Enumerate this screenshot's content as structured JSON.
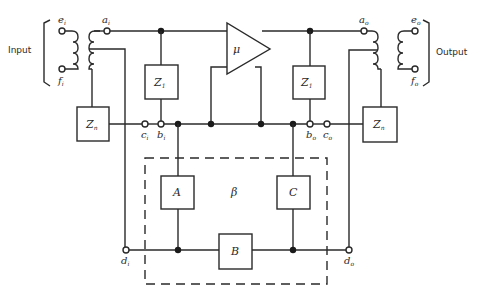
{
  "diagram": {
    "labels": {
      "input": "Input",
      "output": "Output",
      "amplifier": "μ",
      "beta": "β"
    },
    "terminals": {
      "e_i": {
        "main": "e",
        "sub": "i"
      },
      "f_i": {
        "main": "f",
        "sub": "i"
      },
      "a_i": {
        "main": "a",
        "sub": "i"
      },
      "b_i": {
        "main": "b",
        "sub": "i"
      },
      "c_i": {
        "main": "c",
        "sub": "i"
      },
      "d_i": {
        "main": "d",
        "sub": "i"
      },
      "e_o": {
        "main": "e",
        "sub": "o"
      },
      "f_o": {
        "main": "f",
        "sub": "o"
      },
      "a_o": {
        "main": "a",
        "sub": "o"
      },
      "b_o": {
        "main": "b",
        "sub": "o"
      },
      "c_o": {
        "main": "c",
        "sub": "o"
      },
      "d_o": {
        "main": "d",
        "sub": "o"
      }
    },
    "boxes": {
      "z1_left": {
        "main": "Z",
        "sub": "1"
      },
      "z1_right": {
        "main": "Z",
        "sub": "1"
      },
      "zn_left": {
        "main": "Z",
        "sub": "n"
      },
      "zn_right": {
        "main": "Z",
        "sub": "n"
      },
      "a": {
        "main": "A"
      },
      "b": {
        "main": "B"
      },
      "c": {
        "main": "C"
      }
    }
  }
}
